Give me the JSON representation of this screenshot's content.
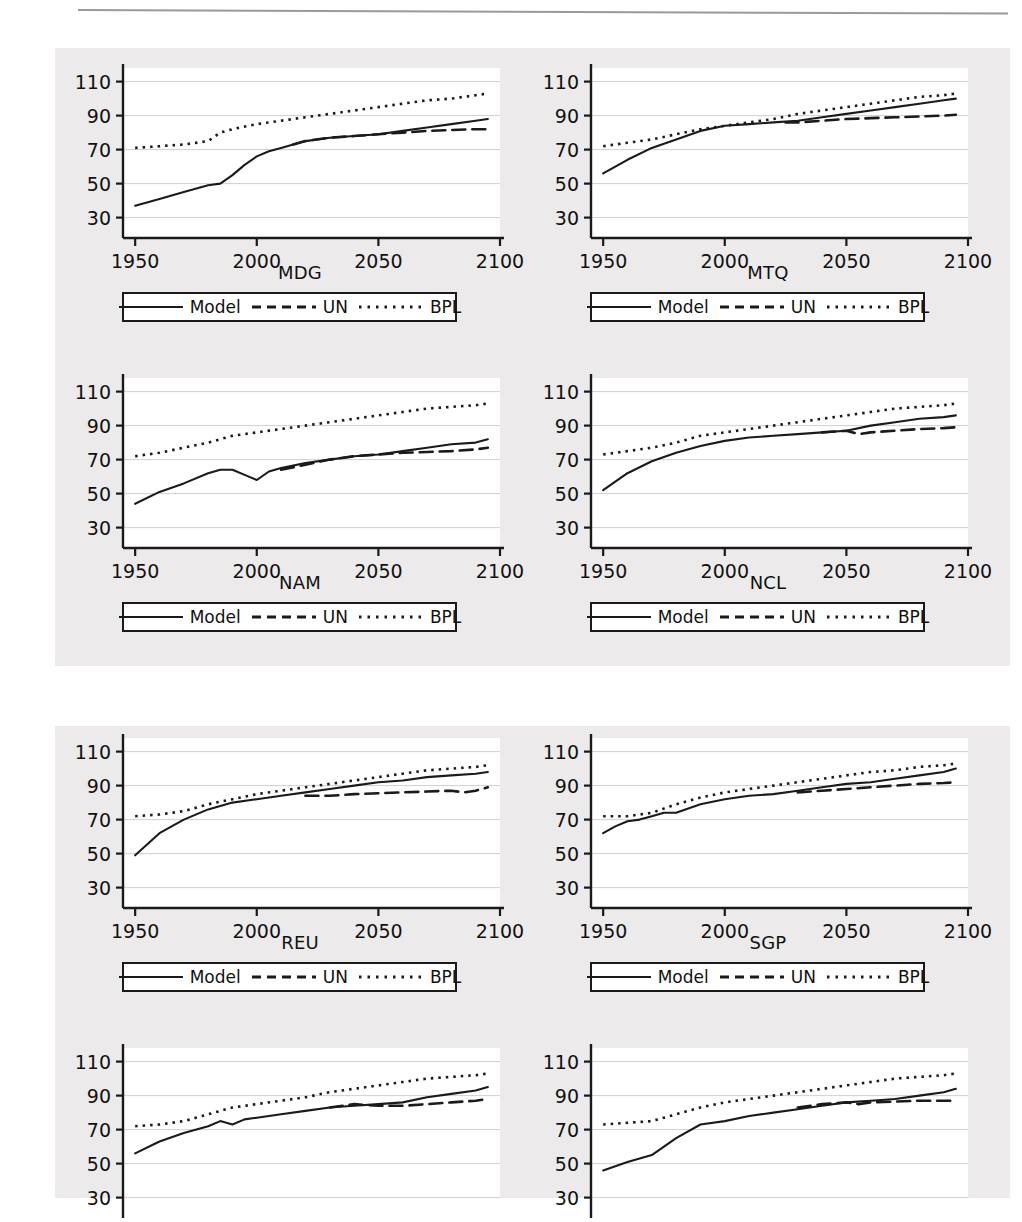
{
  "page": {
    "folio": "",
    "header_rule": true
  },
  "legend": {
    "entries": [
      {
        "label": "Model",
        "style": "solid",
        "icon": "solid-line-swatch"
      },
      {
        "label": "UN",
        "style": "dashed",
        "icon": "dashed-line-swatch"
      },
      {
        "label": "BPL",
        "style": "dotted",
        "icon": "dotted-line-swatch"
      }
    ]
  },
  "axes": {
    "yticks": [
      110,
      90,
      70,
      50,
      30
    ],
    "ylim": [
      18,
      118
    ],
    "xticks": [
      1950,
      2000,
      2050,
      2100
    ],
    "xlim": [
      1945,
      2100
    ],
    "grid": "horizontal-only"
  },
  "colors": {
    "figure_background": "#eceaea",
    "plot_background": "#ffffff",
    "axis": "#1a1a1a",
    "grid": "#c9c9c9",
    "series": "#1a1a1a"
  },
  "chart_data": {
    "type": "line",
    "title": "",
    "xlabel": "",
    "ylabel": "",
    "xlim": [
      1945,
      2100
    ],
    "ylim": [
      18,
      118
    ],
    "grid": true,
    "legend_position": "below-panel",
    "series_names": [
      "Model",
      "UN",
      "BPL"
    ],
    "panels": [
      {
        "code": "MDG",
        "group": 1,
        "clipped": false,
        "series": [
          {
            "name": "Model",
            "style": "solid",
            "x": [
              1950,
              1960,
              1970,
              1980,
              1985,
              1990,
              1995,
              2000,
              2005,
              2010,
              2015,
              2020,
              2030,
              2040,
              2050,
              2060,
              2070,
              2080,
              2090,
              2095
            ],
            "y": [
              37,
              41,
              45,
              49,
              50,
              55,
              61,
              66,
              69,
              71,
              73,
              75,
              77,
              78,
              79,
              81,
              83,
              85,
              87,
              88
            ]
          },
          {
            "name": "UN",
            "style": "dashed",
            "x": [
              2015,
              2020,
              2030,
              2040,
              2050,
              2060,
              2070,
              2080,
              2090,
              2095
            ],
            "y": [
              73,
              75,
              77,
              78,
              79,
              80,
              81,
              81.5,
              82,
              82
            ]
          },
          {
            "name": "BPL",
            "style": "dotted",
            "x": [
              1950,
              1960,
              1970,
              1980,
              1985,
              1990,
              2000,
              2010,
              2020,
              2030,
              2040,
              2050,
              2060,
              2070,
              2080,
              2090,
              2095
            ],
            "y": [
              71,
              72,
              73,
              75,
              80,
              82,
              85,
              87,
              89,
              91,
              93,
              95,
              97,
              99,
              100,
              102,
              103
            ]
          }
        ]
      },
      {
        "code": "MTQ",
        "group": 1,
        "clipped": false,
        "series": [
          {
            "name": "Model",
            "style": "solid",
            "x": [
              1950,
              1960,
              1970,
              1980,
              1990,
              2000,
              2010,
              2020,
              2030,
              2040,
              2050,
              2060,
              2070,
              2080,
              2090,
              2095
            ],
            "y": [
              56,
              64,
              71,
              76,
              81,
              84,
              85,
              86,
              87,
              89,
              91,
              93,
              95,
              97,
              99,
              100
            ]
          },
          {
            "name": "UN",
            "style": "dashed",
            "x": [
              2025,
              2030,
              2040,
              2050,
              2060,
              2070,
              2080,
              2090,
              2095
            ],
            "y": [
              86,
              86,
              87,
              88,
              88.5,
              89,
              89.5,
              90,
              90.5
            ]
          },
          {
            "name": "BPL",
            "style": "dotted",
            "x": [
              1950,
              1960,
              1970,
              1980,
              1990,
              2000,
              2010,
              2020,
              2030,
              2040,
              2050,
              2060,
              2070,
              2080,
              2090,
              2095
            ],
            "y": [
              72,
              74,
              76,
              79,
              82,
              84,
              86,
              88,
              91,
              93,
              95,
              97,
              99,
              101,
              102,
              103
            ]
          }
        ]
      },
      {
        "code": "NAM",
        "group": 1,
        "clipped": false,
        "series": [
          {
            "name": "Model",
            "style": "solid",
            "x": [
              1950,
              1960,
              1970,
              1980,
              1985,
              1990,
              1995,
              2000,
              2005,
              2010,
              2020,
              2030,
              2040,
              2050,
              2060,
              2070,
              2080,
              2090,
              2095
            ],
            "y": [
              44,
              51,
              56,
              62,
              64,
              64,
              61,
              58,
              63,
              65,
              68,
              70,
              72,
              73,
              75,
              77,
              79,
              80,
              82
            ]
          },
          {
            "name": "UN",
            "style": "dashed",
            "x": [
              2010,
              2020,
              2030,
              2040,
              2050,
              2060,
              2070,
              2080,
              2090,
              2095
            ],
            "y": [
              64,
              67,
              70,
              72,
              73,
              74,
              74.5,
              75,
              76,
              77
            ]
          },
          {
            "name": "BPL",
            "style": "dotted",
            "x": [
              1950,
              1960,
              1970,
              1980,
              1990,
              2000,
              2010,
              2020,
              2030,
              2040,
              2050,
              2060,
              2070,
              2080,
              2090,
              2095
            ],
            "y": [
              72,
              74,
              77,
              80,
              84,
              86,
              88,
              90,
              92,
              94,
              96,
              98,
              100,
              101,
              102,
              103
            ]
          }
        ]
      },
      {
        "code": "NCL",
        "group": 1,
        "clipped": false,
        "series": [
          {
            "name": "Model",
            "style": "solid",
            "x": [
              1950,
              1960,
              1970,
              1980,
              1990,
              2000,
              2010,
              2020,
              2030,
              2040,
              2050,
              2060,
              2070,
              2080,
              2090,
              2095
            ],
            "y": [
              52,
              62,
              69,
              74,
              78,
              81,
              83,
              84,
              85,
              86,
              87,
              90,
              92,
              94,
              95,
              96
            ]
          },
          {
            "name": "UN",
            "style": "dashed",
            "x": [
              2040,
              2050,
              2055,
              2060,
              2070,
              2080,
              2090,
              2095
            ],
            "y": [
              86,
              87,
              85,
              86,
              87,
              88,
              88.5,
              89
            ]
          },
          {
            "name": "BPL",
            "style": "dotted",
            "x": [
              1950,
              1960,
              1970,
              1980,
              1990,
              2000,
              2010,
              2020,
              2030,
              2040,
              2050,
              2060,
              2070,
              2080,
              2090,
              2095
            ],
            "y": [
              73,
              75,
              77,
              80,
              84,
              86,
              88,
              90,
              92,
              94,
              96,
              98,
              100,
              101,
              102,
              103
            ]
          }
        ]
      },
      {
        "code": "REU",
        "group": 2,
        "clipped": false,
        "series": [
          {
            "name": "Model",
            "style": "solid",
            "x": [
              1950,
              1960,
              1970,
              1980,
              1990,
              2000,
              2010,
              2020,
              2030,
              2040,
              2050,
              2060,
              2070,
              2080,
              2090,
              2095
            ],
            "y": [
              49,
              62,
              70,
              76,
              80,
              82,
              84,
              86,
              88,
              90,
              92,
              93,
              95,
              96,
              97,
              98
            ]
          },
          {
            "name": "UN",
            "style": "dashed",
            "x": [
              2020,
              2030,
              2040,
              2050,
              2060,
              2070,
              2080,
              2085,
              2090,
              2095
            ],
            "y": [
              84,
              84,
              85,
              85.5,
              86,
              86.5,
              87,
              86,
              87,
              89
            ]
          },
          {
            "name": "BPL",
            "style": "dotted",
            "x": [
              1950,
              1960,
              1970,
              1980,
              1990,
              2000,
              2010,
              2020,
              2030,
              2040,
              2050,
              2060,
              2070,
              2080,
              2090,
              2095
            ],
            "y": [
              72,
              73,
              75,
              79,
              82,
              85,
              87,
              89,
              91,
              93,
              95,
              97,
              99,
              100,
              101,
              102
            ]
          }
        ]
      },
      {
        "code": "SGP",
        "group": 2,
        "clipped": false,
        "series": [
          {
            "name": "Model",
            "style": "solid",
            "x": [
              1950,
              1955,
              1960,
              1965,
              1970,
              1975,
              1980,
              1990,
              2000,
              2010,
              2020,
              2030,
              2040,
              2050,
              2060,
              2070,
              2080,
              2090,
              2095
            ],
            "y": [
              62,
              66,
              69,
              70,
              72,
              74,
              74,
              79,
              82,
              84,
              85,
              87,
              89,
              91,
              92,
              94,
              96,
              98,
              100
            ]
          },
          {
            "name": "UN",
            "style": "dashed",
            "x": [
              2030,
              2040,
              2050,
              2060,
              2070,
              2080,
              2090,
              2095
            ],
            "y": [
              86,
              87,
              88,
              89,
              90,
              91,
              91.5,
              92
            ]
          },
          {
            "name": "BPL",
            "style": "dotted",
            "x": [
              1950,
              1960,
              1970,
              1980,
              1990,
              2000,
              2010,
              2020,
              2030,
              2040,
              2050,
              2060,
              2070,
              2080,
              2090,
              2095
            ],
            "y": [
              72,
              72,
              74,
              79,
              83,
              86,
              88,
              90,
              92,
              94,
              96,
              98,
              99,
              101,
              102,
              103
            ]
          }
        ]
      },
      {
        "code": "",
        "group": 2,
        "clipped": true,
        "series": [
          {
            "name": "Model",
            "style": "solid",
            "x": [
              1950,
              1960,
              1970,
              1980,
              1985,
              1990,
              1995,
              2000,
              2010,
              2020,
              2030,
              2040,
              2050,
              2060,
              2070,
              2080,
              2090,
              2095
            ],
            "y": [
              56,
              63,
              68,
              72,
              75,
              73,
              76,
              77,
              79,
              81,
              83,
              84,
              85,
              86,
              89,
              91,
              93,
              95
            ]
          },
          {
            "name": "UN",
            "style": "dashed",
            "x": [
              2030,
              2040,
              2050,
              2060,
              2070,
              2080,
              2090,
              2095
            ],
            "y": [
              83,
              85,
              84,
              84,
              85,
              86,
              87,
              88
            ]
          },
          {
            "name": "BPL",
            "style": "dotted",
            "x": [
              1950,
              1960,
              1970,
              1980,
              1990,
              2000,
              2010,
              2020,
              2030,
              2040,
              2050,
              2060,
              2070,
              2080,
              2090,
              2095
            ],
            "y": [
              72,
              73,
              75,
              79,
              83,
              85,
              87,
              89,
              92,
              94,
              96,
              98,
              100,
              101,
              102,
              103
            ]
          }
        ]
      },
      {
        "code": "",
        "group": 2,
        "clipped": true,
        "series": [
          {
            "name": "Model",
            "style": "solid",
            "x": [
              1950,
              1960,
              1970,
              1980,
              1990,
              2000,
              2010,
              2020,
              2030,
              2040,
              2050,
              2060,
              2070,
              2080,
              2090,
              2095
            ],
            "y": [
              46,
              51,
              55,
              65,
              73,
              75,
              78,
              80,
              82,
              84,
              86,
              87,
              88,
              90,
              92,
              94
            ]
          },
          {
            "name": "UN",
            "style": "dashed",
            "x": [
              2030,
              2040,
              2050,
              2055,
              2060,
              2070,
              2080,
              2090,
              2095
            ],
            "y": [
              83,
              85,
              86,
              85,
              86,
              86.5,
              87,
              87,
              87
            ]
          },
          {
            "name": "BPL",
            "style": "dotted",
            "x": [
              1950,
              1960,
              1970,
              1980,
              1990,
              2000,
              2010,
              2020,
              2030,
              2040,
              2050,
              2060,
              2070,
              2080,
              2090,
              2095
            ],
            "y": [
              73,
              74,
              75,
              79,
              83,
              86,
              88,
              90,
              92,
              94,
              96,
              98,
              100,
              101,
              102,
              103
            ]
          }
        ]
      }
    ]
  }
}
